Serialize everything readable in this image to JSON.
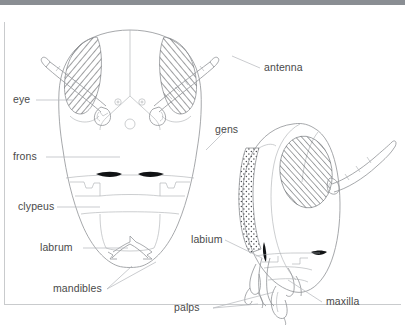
{
  "figure": {
    "kind": "anatomical-line-diagram",
    "background_color": "#ffffff",
    "line_color": "#8f9296",
    "label_color": "#4a4a4a",
    "topbar_color": "#8a8e93",
    "frame_color": "#c9cbcd"
  },
  "labels": {
    "eye": "eye",
    "frons": "frons",
    "clypeus": "clypeus",
    "labrum": "labrum",
    "mandibles": "mandibles",
    "antenna": "antenna",
    "gens": "gens",
    "labium": "labium",
    "palps": "palps",
    "maxilla": "maxilla"
  },
  "views": {
    "frontal": {
      "name": "frontal head view",
      "parts": [
        "compound eye left",
        "compound eye right",
        "antenna left",
        "antenna right",
        "frons",
        "ocelli",
        "clypeus",
        "labrum",
        "mandibles"
      ]
    },
    "lateral": {
      "name": "lateral head view",
      "parts": [
        "compound eye",
        "gena",
        "antenna",
        "labium",
        "maxilla",
        "palps"
      ]
    }
  }
}
